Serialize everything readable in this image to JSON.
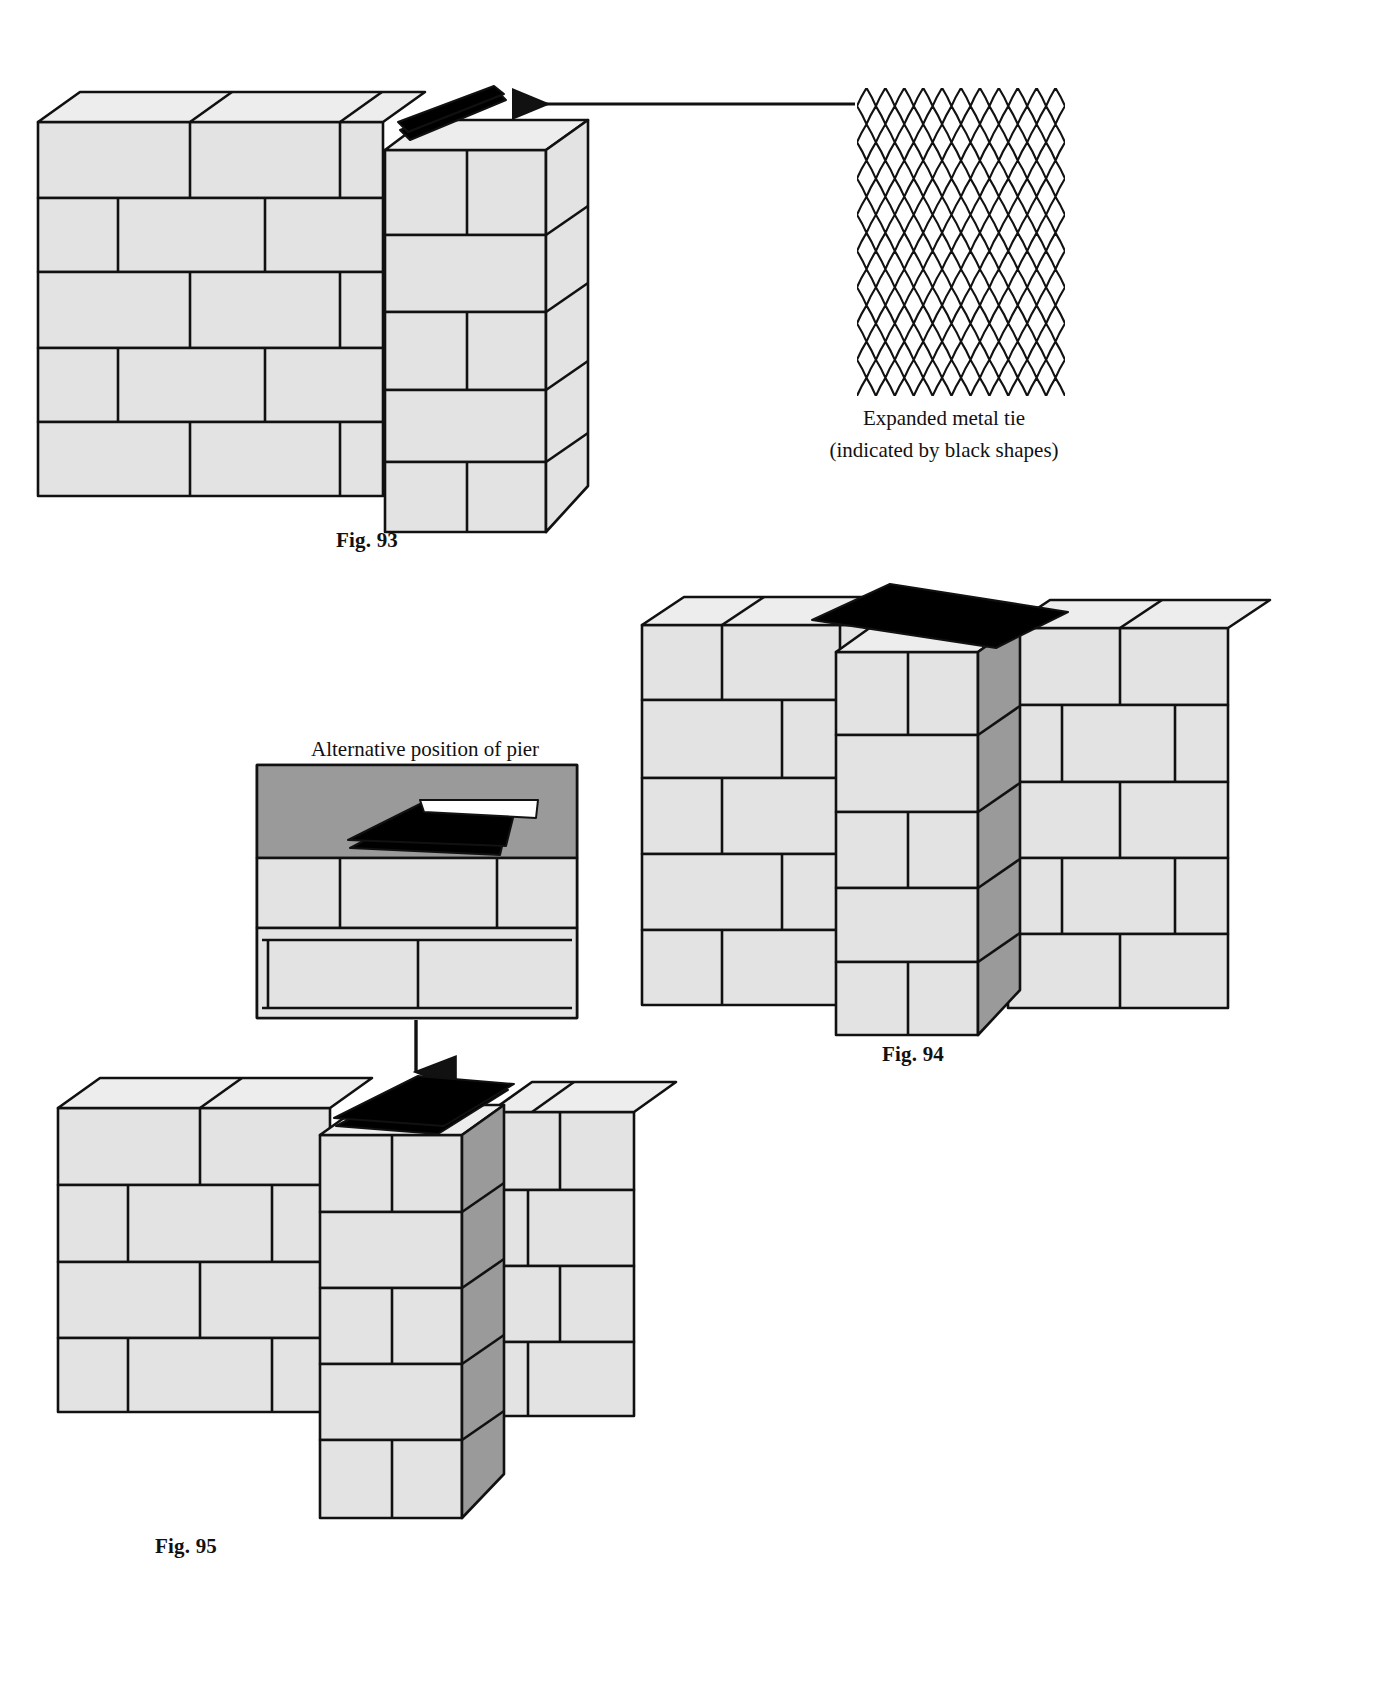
{
  "page": {
    "kind": "technical-illustration",
    "background_color": "#ffffff",
    "ink_color": "#111111",
    "block_face_color": "#e3e3e3",
    "block_side_color": "#9a9a9a",
    "block_top_color": "#ededed",
    "tie_color": "#000000"
  },
  "figures": [
    {
      "id": "fig-93",
      "caption": "Fig. 93",
      "caption_x": 336,
      "caption_y": 528,
      "description": "Block wall with pier bonded at the end, expanded metal tie laid on top course"
    },
    {
      "id": "fig-94",
      "caption": "Fig. 94",
      "caption_x": 882,
      "caption_y": 1042,
      "description": "Block wall with intermediate pier, expanded metal tie spanning the joint"
    },
    {
      "id": "fig-95",
      "caption": "Fig. 95",
      "caption_x": 155,
      "caption_y": 1534,
      "description": "Block wall with pier in alternative position, expanded metal tie on pier top"
    }
  ],
  "annotations": {
    "mesh": {
      "line1": "Expanded metal tie",
      "line2": "(indicated by black shapes)",
      "x": 839,
      "y": 406,
      "width": 210
    },
    "alt_pier": {
      "text": "Alternative position of pier",
      "x": 311,
      "y": 737
    }
  },
  "leader": {
    "name": "tie-leader-line",
    "from_x": 855,
    "from_y": 104,
    "to_x": 506,
    "to_y": 104,
    "arrowhead": "left"
  },
  "down_arrow": {
    "name": "alt-position-arrow",
    "x": 416,
    "from_y": 1020,
    "to_y": 1068,
    "arrowhead": "down"
  }
}
